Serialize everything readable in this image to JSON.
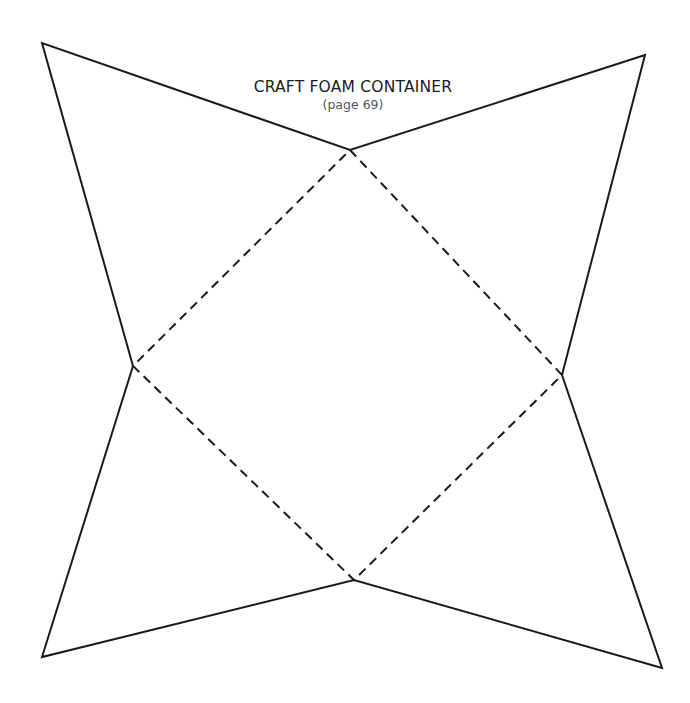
{
  "title": "CRAFT FOAM CONTAINER",
  "subtitle": "(page 69)",
  "colors": {
    "line": "#1a1a1a",
    "background": "#ffffff"
  },
  "vertices": {
    "top_left": [
      42,
      43
    ],
    "top_right": [
      645,
      55
    ],
    "bottom_left": [
      42,
      657
    ],
    "bottom_right": [
      662,
      668
    ],
    "square_top": [
      350,
      150
    ],
    "square_left": [
      133,
      366
    ],
    "square_right": [
      562,
      375
    ],
    "square_bottom": [
      354,
      580
    ]
  },
  "line_styles": {
    "cut": "solid",
    "fold": "dashed"
  }
}
